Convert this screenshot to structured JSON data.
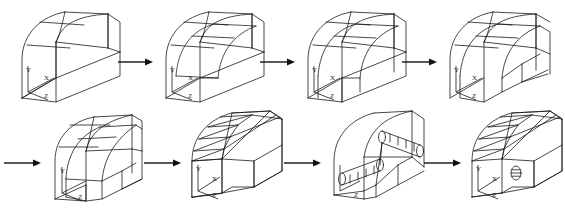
{
  "figure": {
    "type": "cad-modeling-sequence",
    "title": "",
    "rows": 2,
    "steps_per_row": 4,
    "total_steps": 8,
    "stroke_color": "#1a1a1a",
    "background_color": "#ffffff",
    "line_width": 0.8
  },
  "axes": {
    "labels": {
      "x": "X",
      "y": "Y",
      "z": "Z"
    },
    "note": "isometric triad drawn at the lower-left origin corner of each solid"
  },
  "arrows": {
    "count": 7,
    "glyph": "arrow-right",
    "style": "solid line with filled triangular head",
    "color": "#111111"
  },
  "steps": [
    {
      "index": 1,
      "row": 1,
      "position": 1,
      "name": "base-arched-block",
      "caption": "",
      "axis_labels": [
        "Y",
        "X",
        "Z"
      ],
      "features": "rectangular prism with single arched (quarter-round) top surface, wireframe",
      "shaded": false,
      "meshed": false,
      "holes": 0
    },
    {
      "index": 2,
      "row": 1,
      "position": 2,
      "name": "arch-tunnel-added",
      "caption": "",
      "axis_labels": [
        "Y",
        "X",
        "Z"
      ],
      "features": "second interior arch curve swept through the block forming a tunnel",
      "shaded": false,
      "meshed": false,
      "holes": 0
    },
    {
      "index": 3,
      "row": 1,
      "position": 3,
      "name": "inner-arch-refined",
      "caption": "",
      "axis_labels": [
        "Y",
        "X",
        "Z"
      ],
      "features": "inner arch trimmed, vertical partition faces added",
      "shaded": false,
      "meshed": false,
      "holes": 0
    },
    {
      "index": 4,
      "row": 1,
      "position": 4,
      "name": "step-notch-cut",
      "caption": "",
      "axis_labels": [
        "Y",
        "X",
        "Z"
      ],
      "features": "rectangular step notch cut into the lower front region, rear flange extended",
      "shaded": false,
      "meshed": false,
      "holes": 0
    },
    {
      "index": 5,
      "row": 2,
      "position": 1,
      "name": "wireframe-complete",
      "caption": "",
      "axis_labels": [
        "Y",
        "Z"
      ],
      "features": "complete wireframe of arched body with front step and side recess",
      "shaded": false,
      "meshed": false,
      "holes": 0
    },
    {
      "index": 6,
      "row": 2,
      "position": 2,
      "name": "surface-triangulated",
      "caption": "",
      "axis_labels": [
        "Y",
        "X",
        "Z"
      ],
      "features": "curved top surface tessellated into triangular facets, solid opaque faces",
      "shaded": true,
      "meshed": true,
      "holes": 0
    },
    {
      "index": 7,
      "row": 2,
      "position": 3,
      "name": "cylindrical-holes-added",
      "caption": "",
      "axis_labels": [
        "Z"
      ],
      "features": "two horizontal cylindrical bores constructed through the body, wireframe cylinders shown",
      "shaded": false,
      "meshed": false,
      "holes": 2
    },
    {
      "index": 8,
      "row": 2,
      "position": 4,
      "name": "final-solid-model",
      "caption": "",
      "axis_labels": [
        "Y",
        "X",
        "Z"
      ],
      "features": "finished solid: triangulated arch surface, front step, single elliptical hole visible on the angled front face",
      "shaded": true,
      "meshed": true,
      "holes": 1
    }
  ]
}
